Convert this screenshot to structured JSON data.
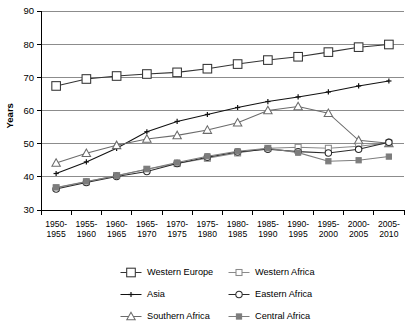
{
  "chart_data": {
    "type": "line",
    "title": "",
    "xlabel": "",
    "ylabel": "Years",
    "ylim": [
      30,
      90
    ],
    "yticks": [
      30,
      40,
      50,
      60,
      70,
      80,
      90
    ],
    "grid": true,
    "legend_position": "bottom",
    "categories": [
      "1950-1955",
      "1955-1960",
      "1960-1965",
      "1965-1970",
      "1970-1975",
      "1975-1980",
      "1980-1985",
      "1985-1990",
      "1990-1995",
      "1995-2000",
      "2000-2005",
      "2005-2010"
    ],
    "series": [
      {
        "name": "Western Europe",
        "marker": "open-square-large",
        "color": "#333333",
        "values": [
          67.4,
          69.5,
          70.4,
          71.0,
          71.5,
          72.6,
          74.0,
          75.2,
          76.2,
          77.6,
          79.1,
          79.9
        ]
      },
      {
        "name": "Asia",
        "marker": "plus",
        "color": "#111111",
        "values": [
          41.0,
          44.5,
          48.6,
          53.6,
          56.7,
          58.8,
          60.9,
          62.7,
          64.1,
          65.6,
          67.4,
          68.9
        ]
      },
      {
        "name": "Southern Africa",
        "marker": "open-triangle",
        "color": "#6b6b6b",
        "values": [
          44.2,
          47.1,
          49.5,
          51.4,
          52.5,
          54.1,
          56.3,
          60.0,
          61.2,
          59.2,
          51.0,
          50.1
        ]
      },
      {
        "name": "Western Africa",
        "marker": "open-square-small",
        "color": "#8a8a8a",
        "values": [
          36.7,
          38.5,
          40.4,
          42.3,
          44.0,
          45.6,
          47.2,
          48.6,
          48.9,
          48.6,
          49.2,
          50.2
        ]
      },
      {
        "name": "Eastern Africa",
        "marker": "open-circle",
        "color": "#2b2b2b",
        "values": [
          36.3,
          38.3,
          40.1,
          41.6,
          44.0,
          45.9,
          47.5,
          48.3,
          47.6,
          47.2,
          48.3,
          50.4
        ]
      },
      {
        "name": "Central Africa",
        "marker": "filled-square-small",
        "color": "#7d7d7d",
        "values": [
          36.8,
          38.6,
          40.3,
          42.3,
          44.3,
          46.2,
          47.7,
          48.6,
          47.3,
          44.7,
          45.0,
          46.1
        ]
      }
    ]
  },
  "legend": {
    "entries": [
      {
        "label": "Western Europe"
      },
      {
        "label": "Western Africa"
      },
      {
        "label": "Asia"
      },
      {
        "label": "Eastern Africa"
      },
      {
        "label": "Southern Africa"
      },
      {
        "label": "Central Africa"
      }
    ]
  }
}
